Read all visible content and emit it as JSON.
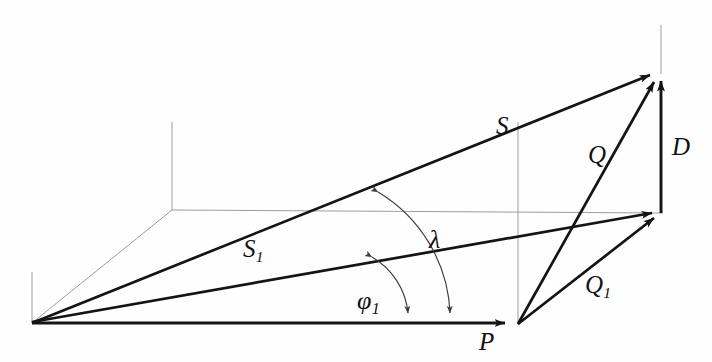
{
  "figure": {
    "type": "vector-diagram",
    "title": "",
    "background": "#fefefe",
    "width": 712,
    "height": 362,
    "colors": {
      "vector_stroke": "#141414",
      "construction_stroke": "#9a9a9a",
      "arc_stroke": "#4a4a4a",
      "label_color": "#111111"
    },
    "points": {
      "origin": {
        "x": 32,
        "y": 323
      },
      "P_tip": {
        "x": 513,
        "y": 323
      },
      "P_vertex": {
        "x": 518,
        "y": 324
      },
      "apex": {
        "x": 659,
        "y": 72
      },
      "right_mid": {
        "x": 663,
        "y": 213
      },
      "box_corner": {
        "x": 172,
        "y": 210
      },
      "box_top": {
        "x": 172,
        "y": 122
      },
      "axis_left_top": {
        "x": 32,
        "y": 272
      },
      "apex_line_top": {
        "x": 661,
        "y": 25
      },
      "mid_line_top": {
        "x": 518,
        "y": 122
      }
    },
    "vectors": [
      {
        "name": "S",
        "label": "S",
        "subscript": "",
        "from": "origin",
        "to": "apex",
        "arrow": "end"
      },
      {
        "name": "S1",
        "label": "S",
        "subscript": "1",
        "from": "origin",
        "to": "right_mid",
        "arrow": "end"
      },
      {
        "name": "P",
        "label": "P",
        "subscript": "",
        "from": "origin",
        "to": "P_tip",
        "arrow": "end"
      },
      {
        "name": "Q",
        "label": "Q",
        "subscript": "",
        "from": "P_vertex",
        "to": "apex",
        "arrow": "end"
      },
      {
        "name": "Q1",
        "label": "Q",
        "subscript": "1",
        "from": "P_vertex",
        "to": "right_mid",
        "arrow": "end"
      },
      {
        "name": "D",
        "label": "D",
        "subscript": "",
        "from": "right_mid",
        "to": "apex",
        "arrow": "end"
      }
    ],
    "angles": [
      {
        "name": "lambda",
        "label": "λ",
        "subscript": "",
        "between": [
          "S",
          "P"
        ],
        "arrow": "both"
      },
      {
        "name": "phi1",
        "label": "φ",
        "subscript": "1",
        "between": [
          "S1",
          "P"
        ],
        "arrow": "both"
      }
    ],
    "labels": {
      "S": "S",
      "D": "D",
      "Q": "Q",
      "S_base": "S",
      "S_sub": "1",
      "lambda": "λ",
      "Q_base": "Q",
      "Q_sub": "1",
      "phi": "φ",
      "phi_sub": "1",
      "P": "P"
    },
    "construction_lines": [
      {
        "name": "left-vertical-axis",
        "from": "axis_left_top",
        "to": "origin"
      },
      {
        "name": "base-diagonal",
        "from": "origin",
        "to": "box_corner"
      },
      {
        "name": "back-vertical",
        "from": "box_top",
        "to": "box_corner"
      },
      {
        "name": "back-horizontal",
        "from": "box_corner",
        "to": "right_mid"
      },
      {
        "name": "mid-vertical",
        "from": "mid_line_top",
        "to": "P_vertex"
      },
      {
        "name": "apex-vertical",
        "from": "apex_line_top",
        "to": "apex"
      }
    ]
  }
}
